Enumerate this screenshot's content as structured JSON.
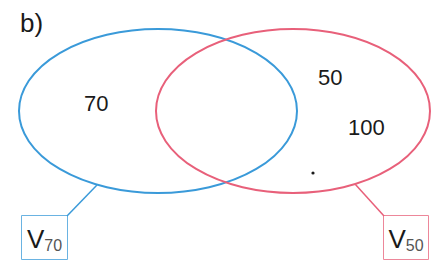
{
  "diagram": {
    "part_label": "b)",
    "colors": {
      "set_a": "#3a9ad9",
      "set_b": "#e8607a",
      "text": "#1a1a1a"
    },
    "sets": [
      {
        "id": "V70",
        "name": "V",
        "subscript": "70",
        "color": "#3a9ad9",
        "elements": [
          "70"
        ]
      },
      {
        "id": "V50",
        "name": "V",
        "subscript": "50",
        "color": "#e8607a",
        "elements": [
          "50",
          "100"
        ]
      }
    ],
    "region_values": {
      "only_a": "70",
      "only_b_1": "50",
      "only_b_2": "100",
      "dot": "."
    }
  }
}
